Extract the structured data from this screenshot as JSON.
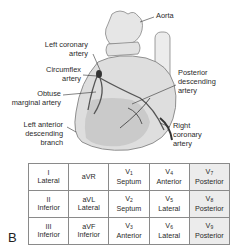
{
  "figure_letter": "B",
  "heart_labels": {
    "aorta": "Aorta",
    "left_coronary_artery": [
      "Left coronary",
      "artery"
    ],
    "circumflex_artery": [
      "Circumflex",
      "artery"
    ],
    "obtuse_marginal_artery": [
      "Obtuse",
      "marginal artery"
    ],
    "left_anterior_descending": [
      "Left anterior",
      "descending",
      "branch"
    ],
    "posterior_descending_artery": [
      "Posterior",
      "descending",
      "artery"
    ],
    "right_coronary_artery": [
      "Right",
      "coronary",
      "artery"
    ]
  },
  "table": {
    "rows": [
      [
        {
          "lead": "I",
          "sub": "",
          "region": "Lateral"
        },
        {
          "lead": "aVR",
          "sub": "",
          "region": ""
        },
        {
          "lead": "V",
          "sub": "1",
          "region": "Septum"
        },
        {
          "lead": "V",
          "sub": "4",
          "region": "Anterior"
        },
        {
          "lead": "V",
          "sub": "7",
          "region": "Posterior"
        }
      ],
      [
        {
          "lead": "II",
          "sub": "",
          "region": "Inferior"
        },
        {
          "lead": "aVL",
          "sub": "",
          "region": "Lateral"
        },
        {
          "lead": "V",
          "sub": "2",
          "region": "Septum"
        },
        {
          "lead": "V",
          "sub": "5",
          "region": "Lateral"
        },
        {
          "lead": "V",
          "sub": "8",
          "region": "Posterior"
        }
      ],
      [
        {
          "lead": "III",
          "sub": "",
          "region": "Inferior"
        },
        {
          "lead": "aVF",
          "sub": "",
          "region": "Inferior"
        },
        {
          "lead": "V",
          "sub": "3",
          "region": "Anterior"
        },
        {
          "lead": "V",
          "sub": "6",
          "region": "Lateral"
        },
        {
          "lead": "V",
          "sub": "9",
          "region": "Posterior"
        }
      ]
    ],
    "shaded_column_color": "#ececec",
    "border_color": "#8a8a8a"
  }
}
